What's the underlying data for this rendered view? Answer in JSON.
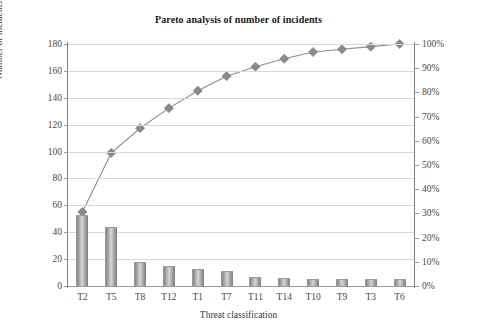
{
  "chart_data": {
    "type": "bar",
    "title": "Pareto analysis of number of incidents",
    "xlabel": "Threat classification",
    "ylabel": "Number of incidents",
    "ylabel_secondary": "",
    "categories": [
      "T2",
      "T5",
      "T8",
      "T12",
      "T1",
      "T7",
      "T11",
      "T14",
      "T10",
      "T9",
      "T3",
      "T6"
    ],
    "values": [
      53,
      44,
      18,
      15,
      13,
      11,
      7,
      6,
      5,
      5,
      5,
      5
    ],
    "series": [
      {
        "name": "Number of incidents",
        "type": "bar",
        "values": [
          53,
          44,
          18,
          15,
          13,
          11,
          7,
          6,
          5,
          5,
          5,
          5
        ]
      },
      {
        "name": "Cumulative percentage",
        "type": "line",
        "axis": "secondary",
        "values": [
          30.6,
          55.0,
          65.2,
          73.5,
          80.7,
          86.7,
          90.6,
          93.9,
          96.7,
          97.8,
          98.9,
          100.0
        ]
      }
    ],
    "ylim": [
      0,
      180
    ],
    "yticks": [
      0,
      20,
      40,
      60,
      80,
      100,
      120,
      140,
      160,
      180
    ],
    "ylim_secondary": [
      0,
      100
    ],
    "yticks_secondary": [
      0,
      10,
      20,
      30,
      40,
      50,
      60,
      70,
      80,
      90,
      100
    ],
    "ytick_labels": [
      "0",
      "20",
      "40",
      "60",
      "80",
      "100",
      "120",
      "140",
      "160",
      "180"
    ],
    "ytick_labels_secondary": [
      "0%",
      "10%",
      "20%",
      "30%",
      "40%",
      "50%",
      "60%",
      "70%",
      "80%",
      "90%",
      "100%"
    ],
    "grid": true,
    "legend": "none",
    "colors": {
      "bar": "#a8a8a8",
      "line": "#8d8d8d",
      "marker": "#8a8a8a",
      "grid": "#d9d9d9",
      "axis": "#808080",
      "text": "#3a3a3a",
      "background": "#ffffff"
    }
  }
}
